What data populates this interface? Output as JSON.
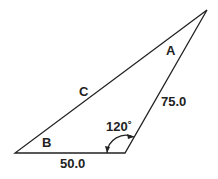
{
  "diagram": {
    "type": "triangle",
    "vertices": {
      "A": {
        "label": "A"
      },
      "B": {
        "label": "B"
      }
    },
    "sides": {
      "c": {
        "label": "C"
      },
      "bottom": {
        "label": "50.0"
      },
      "right": {
        "label": "75.0"
      }
    },
    "angle": {
      "label": "120˚"
    },
    "colors": {
      "line": "#222222",
      "background": "#ffffff"
    }
  }
}
